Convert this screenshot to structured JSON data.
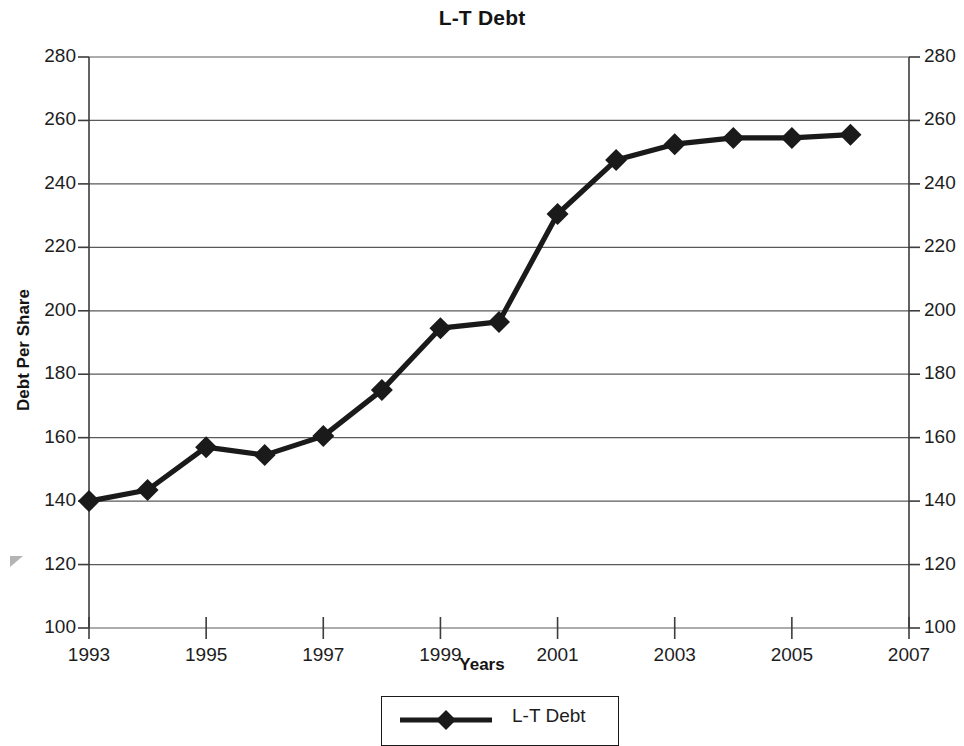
{
  "chart_data": {
    "type": "line",
    "title": "L-T Debt",
    "xlabel": "Years",
    "ylabel": "Debt Per Share",
    "x": [
      1993,
      1994,
      1995,
      1996,
      1997,
      1998,
      1999,
      2000,
      2001,
      2002,
      2003,
      2004,
      2005,
      2006
    ],
    "series": [
      {
        "name": "L-T Debt",
        "values": [
          140,
          143.5,
          157,
          154.5,
          160.5,
          175,
          194.5,
          196.5,
          230.5,
          247.5,
          252.5,
          254.5,
          254.5,
          255.5
        ],
        "color": "#1a1a1a",
        "marker": "diamond"
      }
    ],
    "xlim": [
      1993,
      2007
    ],
    "ylim": [
      100,
      280
    ],
    "xticks": [
      1993,
      1995,
      1997,
      1999,
      2001,
      2003,
      2005,
      2007
    ],
    "xtick_labels": [
      "1993",
      "1995",
      "1997",
      "1999",
      "2001",
      "2003",
      "2005",
      "2007"
    ],
    "yticks": [
      100,
      120,
      140,
      160,
      180,
      200,
      220,
      240,
      260,
      280
    ],
    "ytick_labels": [
      "100",
      "120",
      "140",
      "160",
      "180",
      "200",
      "220",
      "240",
      "260",
      "280"
    ],
    "y_axis_right_labels": [
      "100",
      "120",
      "140",
      "160",
      "180",
      "200",
      "220",
      "240",
      "260",
      "280"
    ],
    "grid": "horizontal",
    "legend": {
      "position": "bottom-center",
      "entries": [
        "L-T Debt"
      ]
    },
    "colors": {
      "line": "#1a1a1a",
      "grid": "#5a5a5a",
      "axis": "#3c3c3c",
      "background": "#ffffff",
      "arrow_marker": "#b4b4b4"
    }
  }
}
